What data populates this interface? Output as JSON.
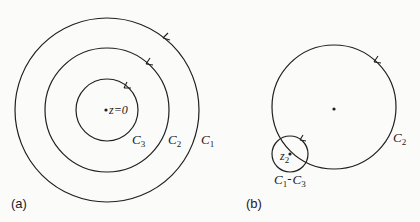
{
  "panels": [
    {
      "id": "a",
      "label": "(a)",
      "center_point_label": "z=0",
      "contours": [
        {
          "name": "C1",
          "label_main": "C",
          "label_sub": "1",
          "radius": 92
        },
        {
          "name": "C2",
          "label_main": "C",
          "label_sub": "2",
          "radius": 62
        },
        {
          "name": "C3",
          "label_main": "C",
          "label_sub": "3",
          "radius": 31
        }
      ],
      "orientation": "counterclockwise"
    },
    {
      "id": "b",
      "label": "(b)",
      "contours": [
        {
          "name": "C2",
          "label_main": "C",
          "label_sub": "2",
          "radius": 62
        },
        {
          "name": "C1-C3",
          "label_main_1": "C",
          "label_sub_1": "1",
          "separator": "-",
          "label_main_2": "C",
          "label_sub_2": "3",
          "radius": 18
        }
      ],
      "singular_point_label_main": "z",
      "singular_point_label_sub": "2",
      "orientation": "counterclockwise"
    }
  ],
  "colors": {
    "stroke": "#1f1f1f",
    "background": "#fbfbfa"
  }
}
